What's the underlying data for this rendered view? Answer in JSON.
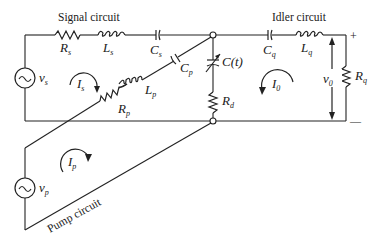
{
  "titles": {
    "signal": "Signal circuit",
    "idler": "Idler circuit",
    "pump": "Pump circuit"
  },
  "components": {
    "Rs": {
      "main": "R",
      "sub": "s"
    },
    "Ls": {
      "main": "L",
      "sub": "s"
    },
    "Cs": {
      "main": "C",
      "sub": "s"
    },
    "Cp": {
      "main": "C",
      "sub": "p"
    },
    "Lp": {
      "main": "L",
      "sub": "p"
    },
    "Rp": {
      "main": "R",
      "sub": "p"
    },
    "Ct": {
      "main": "C(t)"
    },
    "Rd": {
      "main": "R",
      "sub": "d"
    },
    "Cq": {
      "main": "C",
      "sub": "q"
    },
    "Lq": {
      "main": "L",
      "sub": "q"
    },
    "Rq": {
      "main": "R",
      "sub": "q"
    }
  },
  "sources": {
    "vs": {
      "main": "v",
      "sub": "s",
      "glyph": "~"
    },
    "vp": {
      "main": "v",
      "sub": "p",
      "glyph": "~"
    }
  },
  "currents": {
    "Is": {
      "main": "I",
      "sub": "s"
    },
    "I0": {
      "main": "I",
      "sub": "0"
    },
    "Ip": {
      "main": "I",
      "sub": "p"
    }
  },
  "output": {
    "v0": {
      "main": "v",
      "sub": "0"
    },
    "plus": "+",
    "minus": "—"
  }
}
